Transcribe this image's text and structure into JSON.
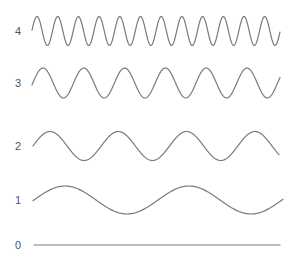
{
  "figure": {
    "line_color": "#7a7a7a",
    "label_color": "#555555",
    "rows": [
      {
        "label": "4",
        "label_x": 11,
        "label_y": 25,
        "type": "sine",
        "x_start": 32,
        "x_end": 280,
        "mid_y": 31,
        "amplitude": 14.5,
        "period": 20.7,
        "phase_x": 37
      },
      {
        "label": "3",
        "label_x": 11,
        "label_y": 77,
        "type": "sine",
        "x_start": 32,
        "x_end": 280,
        "mid_y": 83,
        "amplitude": 15,
        "period": 40.8,
        "phase_x": 43
      },
      {
        "label": "2",
        "label_x": 11,
        "label_y": 140,
        "type": "sine",
        "x_start": 33,
        "x_end": 279,
        "mid_y": 146,
        "amplitude": 14.5,
        "period": 68.3,
        "phase_x": 50
      },
      {
        "label": "1",
        "label_x": 11,
        "label_y": 194,
        "type": "sine",
        "x_start": 33,
        "x_end": 283,
        "mid_y": 200,
        "amplitude": 14,
        "period": 124,
        "phase_x": 65
      },
      {
        "label": "0",
        "label_x": 11,
        "label_y": 239,
        "type": "flat",
        "x_start": 34,
        "x_end": 280,
        "mid_y": 245,
        "amplitude": 0,
        "period": 0,
        "phase_x": 0
      }
    ]
  }
}
